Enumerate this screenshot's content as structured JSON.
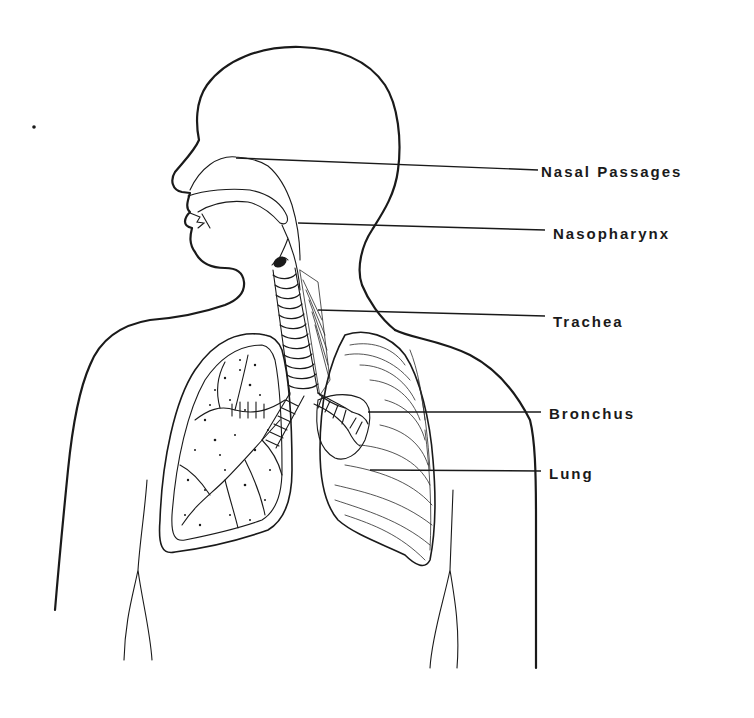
{
  "figure": {
    "colors": {
      "ink": "#1a1a1a",
      "background": "#ffffff"
    },
    "labels": [
      {
        "id": "nasal-passages",
        "text": "Nasal Passages",
        "x": 541,
        "y": 165
      },
      {
        "id": "nasopharynx",
        "text": "Nasopharynx",
        "x": 553,
        "y": 228
      },
      {
        "id": "trachea",
        "text": "Trachea",
        "x": 553,
        "y": 314
      },
      {
        "id": "bronchus",
        "text": "Bronchus",
        "x": 549,
        "y": 410
      },
      {
        "id": "lung",
        "text": "Lung",
        "x": 549,
        "y": 468
      }
    ]
  }
}
